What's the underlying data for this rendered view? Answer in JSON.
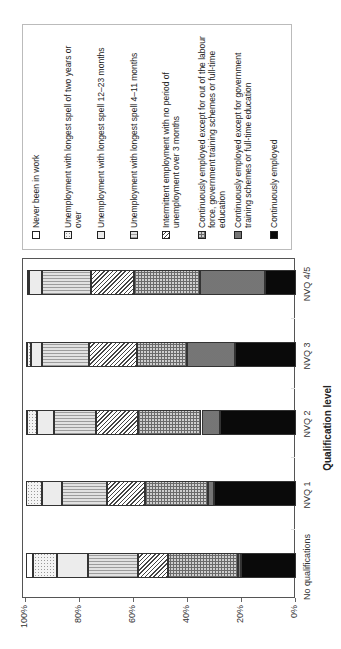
{
  "chart_data": {
    "type": "bar",
    "stacked": true,
    "orientation": "vertical (image rotated 90° counter-clockwise)",
    "title": "",
    "xlabel": "Qualification level",
    "ylabel": "",
    "ylim": [
      0,
      100
    ],
    "yticks": [
      "0%",
      "20%",
      "40%",
      "60%",
      "80%",
      "100%"
    ],
    "categories": [
      "No qualifications",
      "NVQ 1",
      "NVQ 2",
      "NVQ 3",
      "NVQ 4/5"
    ],
    "series": [
      {
        "name": "Continuously employed",
        "values": [
          20.5,
          30.5,
          28.0,
          22.5,
          11.5
        ]
      },
      {
        "name": "Continuously employed except for government training schemes or full-time education",
        "values": [
          1.0,
          2.0,
          7.0,
          18.0,
          24.0
        ]
      },
      {
        "name": "Continuously employed except for out of the labour force, government training schemes or full-time education",
        "values": [
          26.0,
          23.5,
          23.5,
          18.5,
          24.5
        ]
      },
      {
        "name": "Intermittent employment with no period of unemployment over 3 months",
        "values": [
          11.0,
          14.0,
          15.5,
          17.5,
          16.0
        ]
      },
      {
        "name": "Unemployment with longest spell 4–11 months",
        "values": [
          18.5,
          16.5,
          15.5,
          17.5,
          18.0
        ]
      },
      {
        "name": "Unemployment with longest spell 12–23 months",
        "values": [
          11.5,
          7.5,
          6.5,
          4.0,
          5.0
        ]
      },
      {
        "name": "Unemployment with longest spell of two years or over",
        "values": [
          9.0,
          6.0,
          3.5,
          1.5,
          0.5
        ]
      },
      {
        "name": "Never been in work",
        "values": [
          2.5,
          0.0,
          0.5,
          0.5,
          0.0
        ]
      }
    ],
    "legend_position": "right",
    "grid": false
  },
  "axis": {
    "yticks": [
      "100%",
      "80%",
      "60%",
      "40%",
      "20%",
      "0%"
    ],
    "xtitle": "Qualification level",
    "categories": [
      "No qualifications",
      "NVQ 1",
      "NVQ 2",
      "NVQ 3",
      "NVQ 4/5"
    ]
  },
  "legend": {
    "items": [
      {
        "label": "Never been in work",
        "pattern": "p-never"
      },
      {
        "label": "Unemployment with longest spell of two years or over",
        "pattern": "p-2yr"
      },
      {
        "label": "Unemployment with longest spell 12–23 months",
        "pattern": "p-12m"
      },
      {
        "label": "Unemployment with longest spell 4–11 months",
        "pattern": "p-4m"
      },
      {
        "label": "Intermittent employment with no period of unemployment over 3 months",
        "pattern": "p-int"
      },
      {
        "label": "Continuously employed except for out of the labour force, government training schemes or full-time education",
        "pattern": "p-olf"
      },
      {
        "label": "Continuously employed except for government training schemes or full-time education",
        "pattern": "p-gov"
      },
      {
        "label": "Continuously employed",
        "pattern": "p-cont"
      }
    ]
  }
}
